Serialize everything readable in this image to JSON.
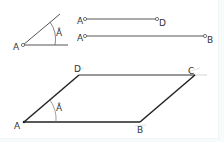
{
  "diagram": {
    "title": "",
    "angle": {
      "vertex_label": "A",
      "angle_label": "Â",
      "vertex": [
        23,
        45
      ],
      "ray1_end": [
        60,
        14
      ],
      "ray2_end": [
        68,
        45
      ]
    },
    "segment_ad": {
      "start_label": "A",
      "end_label": "D",
      "start": [
        85,
        19
      ],
      "end": [
        157,
        19
      ]
    },
    "segment_ab": {
      "start_label": "A",
      "end_label": "B",
      "start": [
        85,
        36
      ],
      "end": [
        205,
        36
      ]
    },
    "parallelogram": {
      "labels": {
        "A": "A",
        "B": "B",
        "C": "C",
        "D": "D"
      },
      "angle_label": "Â",
      "points": {
        "A": [
          24,
          122
        ],
        "B": [
          140,
          122
        ],
        "C": [
          195,
          75
        ],
        "D": [
          79,
          75
        ]
      }
    },
    "colors": {
      "line": "#333333",
      "thin_line": "#555555",
      "arc": "#666666",
      "construction": "#bbbbbb"
    }
  }
}
